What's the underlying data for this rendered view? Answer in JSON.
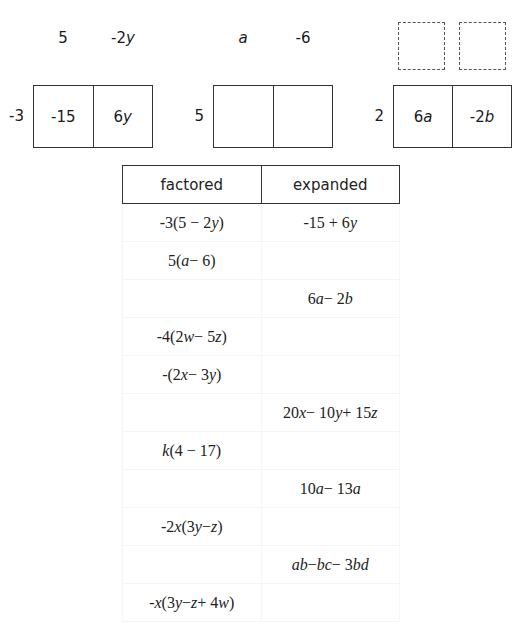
{
  "area_models": [
    {
      "id": "model-1",
      "column_factors": [
        "5",
        "-2y"
      ],
      "row_factor": "-3",
      "products": [
        "-15",
        "6y"
      ]
    },
    {
      "id": "model-2",
      "column_factors": [
        "a",
        "-6"
      ],
      "row_factor": "5",
      "products": [
        "",
        ""
      ]
    },
    {
      "id": "model-3",
      "column_factors": [
        "",
        ""
      ],
      "column_factors_blank": true,
      "row_factor": "2",
      "products": [
        "6a",
        "-2b"
      ]
    }
  ],
  "table": {
    "headers": [
      "factored",
      "expanded"
    ],
    "rows": [
      {
        "factored": "-3(5 − 2y)",
        "expanded": "-15 + 6y"
      },
      {
        "factored": "5(a − 6)",
        "expanded": ""
      },
      {
        "factored": "",
        "expanded": "6a − 2b"
      },
      {
        "factored": "-4(2w − 5z)",
        "expanded": ""
      },
      {
        "factored": "-(2x − 3y)",
        "expanded": ""
      },
      {
        "factored": "",
        "expanded": "20x − 10y + 15z"
      },
      {
        "factored": "k(4 − 17)",
        "expanded": ""
      },
      {
        "factored": "",
        "expanded": "10a − 13a"
      },
      {
        "factored": "-2x(3y − z)",
        "expanded": ""
      },
      {
        "factored": "",
        "expanded": "ab − bc − 3bd"
      },
      {
        "factored": "-x(3y − z + 4w)",
        "expanded": ""
      }
    ]
  },
  "colors": {
    "border": "#333333",
    "text": "#1a1a1a",
    "faint_row_border": "#f4f4f4"
  }
}
